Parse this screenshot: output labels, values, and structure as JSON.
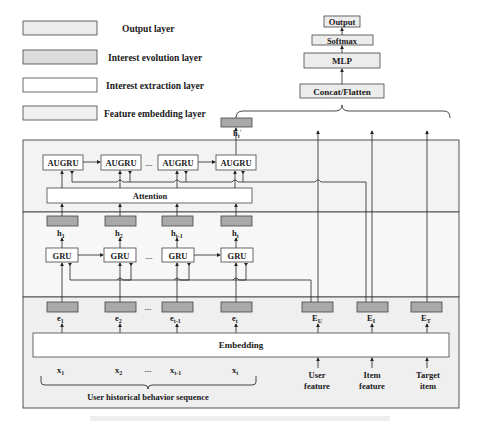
{
  "legend": [
    {
      "label": "Output layer",
      "fill": "#ececec"
    },
    {
      "label": "Interest evolution layer",
      "fill": "#dcdcdc"
    },
    {
      "label": "Interest extraction layer",
      "fill": "#ffffff"
    },
    {
      "label": "Feature embedding layer",
      "fill": "#f0f0f0"
    }
  ],
  "output_stack": {
    "output": "Output",
    "softmax": "Softmax",
    "mlp": "MLP",
    "concat": "Concat/Flatten"
  },
  "interest_evolution": {
    "final_hidden": {
      "base": "h",
      "sub": "t",
      "prime": "'"
    },
    "augru_cells": [
      "AUGRU",
      "AUGRU",
      "AUGRU",
      "AUGRU"
    ],
    "ellipsis": "....",
    "attention": "Attention"
  },
  "interest_extraction": {
    "hidden_states": [
      {
        "base": "h",
        "sub": "1"
      },
      {
        "base": "h",
        "sub": "2"
      },
      {
        "base": "h",
        "sub": "t-1"
      },
      {
        "base": "h",
        "sub": "t"
      }
    ],
    "gru_cells": [
      "GRU",
      "GRU",
      "GRU",
      "GRU"
    ],
    "ellipsis": "...."
  },
  "feature_embedding": {
    "behavior_embeddings": [
      {
        "base": "e",
        "sub": "1"
      },
      {
        "base": "e",
        "sub": "2"
      },
      {
        "base": "e",
        "sub": "t-1"
      },
      {
        "base": "e",
        "sub": "t"
      }
    ],
    "other_embeddings": [
      {
        "base": "E",
        "sub": "U"
      },
      {
        "base": "E",
        "sub": "I"
      },
      {
        "base": "E",
        "sub": "T"
      }
    ],
    "embedding_label": "Embedding",
    "ellipsis": "....",
    "inputs": [
      {
        "base": "x",
        "sub": "1"
      },
      {
        "base": "x",
        "sub": "2"
      },
      {
        "base": "x",
        "sub": "t-1"
      },
      {
        "base": "x",
        "sub": "t"
      }
    ],
    "sequence_label": "User historical behavior sequence",
    "feature_inputs": [
      {
        "line1": "User",
        "line2": "feature"
      },
      {
        "line1": "Item",
        "line2": "feature"
      },
      {
        "line1": "Target",
        "line2": "item"
      }
    ]
  },
  "colors": {
    "grey_box": "#a9a9a9",
    "section_bg_top": "#f3f3f3",
    "section_bg_mid": "#f6f6f6",
    "section_bg_bottom": "#efefef",
    "stroke": "#333333"
  }
}
